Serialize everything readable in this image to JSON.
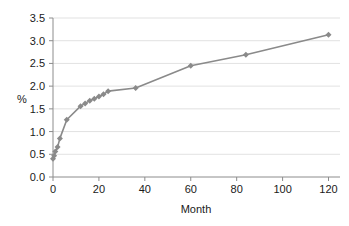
{
  "chart_data": {
    "type": "line",
    "title": "",
    "subtitle": "",
    "xlabel": "Month",
    "ylabel": "%",
    "xlim": [
      0,
      125
    ],
    "ylim": [
      0.0,
      3.5
    ],
    "grid": true,
    "grid_axis": "y",
    "legend": false,
    "legend_position": "none",
    "marker": "diamond",
    "series_color": "#8a8a8a",
    "xticks": [
      0,
      20,
      40,
      60,
      80,
      100,
      120
    ],
    "xtick_labels": [
      "0",
      "20",
      "40",
      "60",
      "80",
      "100",
      "120"
    ],
    "yticks": [
      0.0,
      0.5,
      1.0,
      1.5,
      2.0,
      2.5,
      3.0,
      3.5
    ],
    "ytick_labels": [
      "0.0",
      "0.5",
      "1.0",
      "1.5",
      "2.0",
      "2.5",
      "3.0",
      "3.5"
    ],
    "series": [
      {
        "name": "Cumulative %",
        "x": [
          0,
          0.5,
          1,
          2,
          3,
          6,
          12,
          14,
          16,
          18,
          20,
          22,
          24,
          36,
          60,
          84,
          120
        ],
        "values": [
          0.4,
          0.47,
          0.56,
          0.66,
          0.85,
          1.26,
          1.56,
          1.62,
          1.68,
          1.72,
          1.77,
          1.82,
          1.89,
          1.96,
          2.45,
          2.69,
          3.13
        ]
      }
    ],
    "annotations": []
  },
  "axes": {
    "y_axis_title": "%",
    "x_axis_title": "Month"
  }
}
